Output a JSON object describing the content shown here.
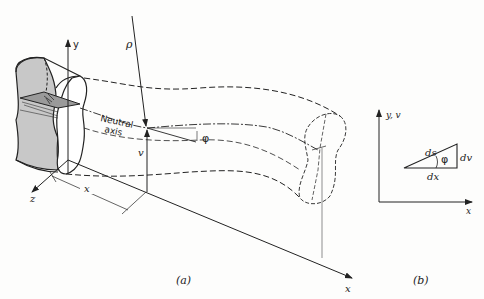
{
  "figure": {
    "panel_a": {
      "caption": "(a)",
      "axes": {
        "y": "y",
        "z": "z",
        "x": "x"
      },
      "labels": {
        "radius": "ρ",
        "neutral_axis_line1": "Neutral",
        "neutral_axis_line2": "axis",
        "slope_angle": "φ",
        "deflection": "v",
        "distance": "x"
      }
    },
    "panel_b": {
      "caption": "(b)",
      "axes": {
        "y": "y, v",
        "x": "x"
      },
      "labels": {
        "arc_length": "ds",
        "angle": "φ",
        "dv": "dv",
        "dx": "dx"
      }
    },
    "colors": {
      "ink": "#222222",
      "shading": "#c8c8c8",
      "background": "#fdfdfc"
    }
  }
}
